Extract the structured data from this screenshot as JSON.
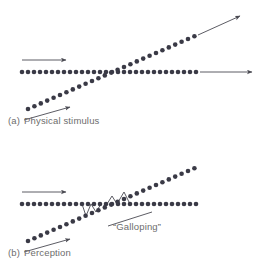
{
  "figure": {
    "panels": [
      {
        "id": "a",
        "tag": "(a)",
        "caption": "Physical stimulus"
      },
      {
        "id": "b",
        "tag": "(b)",
        "caption": "Perception"
      }
    ],
    "annotations": {
      "galloping": "“Galloping”"
    },
    "colors": {
      "dot": "#3a3a46",
      "line": "#4a4a52",
      "caption_text": "#6d6d6d",
      "background": "#ffffff"
    },
    "marker": {
      "shape": "filled-circle",
      "radius_px": 2.3
    }
  },
  "chart_data": {
    "type": "scatter",
    "title": "",
    "xlabel": "Time",
    "ylabel": "Frequency",
    "xlim": [
      0,
      264
    ],
    "ylim": [
      0,
      133
    ],
    "grid": false,
    "legend_position": "none",
    "panels": [
      {
        "id": "a",
        "tag": "(a)",
        "caption": "Physical stimulus",
        "series": [
          {
            "name": "steady-horizontal-tone",
            "type": "scatter",
            "orientation": "horizontal",
            "n_points": 30,
            "x": [
              22,
              28,
              34,
              40,
              46,
              52,
              58,
              64,
              70,
              76,
              82,
              88,
              94,
              100,
              106,
              112,
              118,
              124,
              130,
              136,
              142,
              148,
              154,
              160,
              166,
              172,
              178,
              184,
              190,
              196
            ],
            "y": [
              72,
              72,
              72,
              72,
              72,
              72,
              72,
              72,
              72,
              72,
              72,
              72,
              72,
              72,
              72,
              72,
              72,
              72,
              72,
              72,
              72,
              72,
              72,
              72,
              72,
              72,
              72,
              72,
              72,
              72
            ]
          },
          {
            "name": "rising-glide-tone",
            "type": "scatter",
            "orientation": "diagonal-ascending",
            "n_points": 27,
            "x": [
              28,
              34.4,
              40.8,
              47.2,
              53.6,
              60,
              66.4,
              72.8,
              79.2,
              85.6,
              92,
              98.4,
              104.8,
              111.2,
              117.6,
              124,
              130.4,
              136.8,
              143.2,
              149.6,
              156,
              162.4,
              168.8,
              175.2,
              181.6,
              188,
              194.4
            ],
            "y": [
              109,
              106.2,
              103.4,
              100.6,
              97.8,
              95,
              92.2,
              89.4,
              86.6,
              83.8,
              81,
              78.2,
              75.4,
              72.6,
              69.8,
              67,
              64.2,
              61.4,
              58.6,
              55.8,
              53,
              50.2,
              47.4,
              44.6,
              41.8,
              39,
              36.2
            ]
          }
        ],
        "arrows": [
          {
            "name": "horizontal-motion-arrow-left",
            "x1": 22,
            "y1": 60,
            "x2": 66,
            "y2": 60,
            "direction": "right"
          },
          {
            "name": "horizontal-continuation-arrow-right",
            "x1": 200,
            "y1": 72,
            "x2": 252,
            "y2": 72,
            "direction": "right"
          },
          {
            "name": "diagonal-continuation-arrow-upper-right",
            "x1": 198,
            "y1": 35,
            "x2": 240,
            "y2": 16,
            "direction": "up-right"
          },
          {
            "name": "diagonal-motion-arrow-lower-left",
            "x1": 24,
            "y1": 120,
            "x2": 70,
            "y2": 107,
            "direction": "up-right"
          }
        ]
      },
      {
        "id": "b",
        "tag": "(b)",
        "caption": "Perception",
        "annotation": "“Galloping”",
        "series": [
          {
            "name": "steady-horizontal-tone",
            "type": "scatter",
            "orientation": "horizontal",
            "n_points": 30,
            "x": [
              22,
              28,
              34,
              40,
              46,
              52,
              58,
              64,
              70,
              76,
              82,
              88,
              94,
              100,
              106,
              112,
              118,
              124,
              130,
              136,
              142,
              148,
              154,
              160,
              166,
              172,
              178,
              184,
              190,
              196
            ],
            "y": [
              72,
              72,
              72,
              72,
              72,
              72,
              72,
              72,
              72,
              72,
              72,
              72,
              72,
              72,
              72,
              72,
              72,
              72,
              72,
              72,
              72,
              72,
              72,
              72,
              72,
              72,
              72,
              72,
              72,
              72
            ]
          },
          {
            "name": "rising-glide-tone",
            "type": "scatter",
            "orientation": "diagonal-ascending",
            "n_points": 27,
            "x": [
              28,
              34.4,
              40.8,
              47.2,
              53.6,
              60,
              66.4,
              72.8,
              79.2,
              85.6,
              92,
              98.4,
              104.8,
              111.2,
              117.6,
              124,
              130.4,
              136.8,
              143.2,
              149.6,
              156,
              162.4,
              168.8,
              175.2,
              181.6,
              188,
              194.4
            ],
            "y": [
              109,
              106.2,
              103.4,
              100.6,
              97.8,
              95,
              92.2,
              89.4,
              86.6,
              83.8,
              81,
              78.2,
              75.4,
              72.6,
              69.8,
              67,
              64.2,
              61.4,
              58.6,
              55.8,
              53,
              50.2,
              47.4,
              44.6,
              41.8,
              39,
              36.2
            ]
          }
        ],
        "galloping_connectors": [
          {
            "x1": 82,
            "y1": 72,
            "x2": 86,
            "y2": 84
          },
          {
            "x1": 86,
            "y1": 84,
            "x2": 91,
            "y2": 72
          },
          {
            "x1": 91,
            "y1": 72,
            "x2": 96,
            "y2": 80
          },
          {
            "x1": 96,
            "y1": 80,
            "x2": 101,
            "y2": 72
          },
          {
            "x1": 107,
            "y1": 72,
            "x2": 112,
            "y2": 64
          },
          {
            "x1": 112,
            "y1": 64,
            "x2": 117,
            "y2": 72
          },
          {
            "x1": 117,
            "y1": 72,
            "x2": 124,
            "y2": 60
          },
          {
            "x1": 124,
            "y1": 60,
            "x2": 130,
            "y2": 72
          }
        ],
        "arrows": [
          {
            "name": "horizontal-motion-arrow-left",
            "x1": 22,
            "y1": 60,
            "x2": 66,
            "y2": 60,
            "direction": "right"
          },
          {
            "name": "diagonal-motion-arrow-lower-left",
            "x1": 24,
            "y1": 120,
            "x2": 70,
            "y2": 107,
            "direction": "up-right"
          },
          {
            "name": "galloping-leader-line",
            "x1": 108,
            "y1": 94,
            "x2": 152,
            "y2": 80,
            "direction": "none"
          }
        ]
      }
    ]
  }
}
